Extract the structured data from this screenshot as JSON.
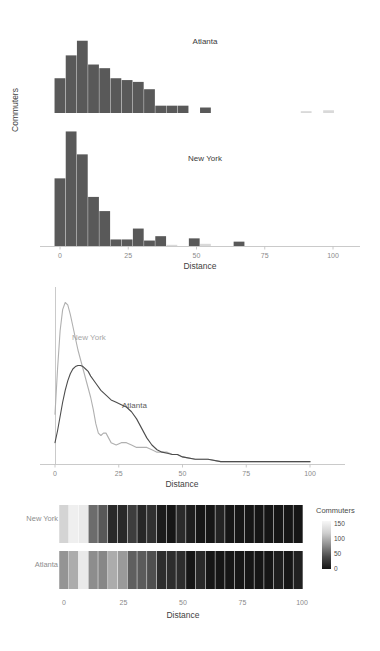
{
  "figure": {
    "title": "",
    "panels": [
      "histogram-facets",
      "density-overlay",
      "heatmap-strips"
    ]
  },
  "colors": {
    "bar": "#595959",
    "bar_faint": "#d9d9d9",
    "axis": "#bdbdbd",
    "tick_text": "#8a8a8a",
    "atlanta_curve": "#4d4d4d",
    "newyork_curve": "#b0b0b0",
    "atlanta_label": "#5b5b5b",
    "newyork_label": "#a8a8a8",
    "heat_low": "#1a1a1a",
    "heat_high": "#f2f2f2"
  },
  "axis": {
    "x_title": "Distance",
    "y_title": "Commuters",
    "x_ticks": [
      "0",
      "25",
      "50",
      "75",
      "100"
    ],
    "x_tick_values": [
      0,
      25,
      50,
      75,
      100
    ],
    "xlim": [
      -3,
      104
    ]
  },
  "panel_histogram": {
    "facets": [
      {
        "label": "Atlanta"
      },
      {
        "label": "New York"
      }
    ]
  },
  "panel_density": {
    "labels": [
      {
        "name": "New York",
        "x": 14,
        "y": 0.048
      },
      {
        "name": "Atlanta",
        "x": 27,
        "y": 0.028
      }
    ]
  },
  "panel_heatmap": {
    "rows": [
      "New York",
      "Atlanta"
    ],
    "legend": {
      "title": "Commuters",
      "ticks": [
        "150",
        "100",
        "50",
        "0"
      ],
      "tick_values": [
        150,
        100,
        50,
        0
      ],
      "range": [
        0,
        160
      ]
    }
  },
  "chart_data": [
    {
      "type": "bar",
      "id": "histogram-atlanta",
      "title": "Atlanta",
      "xlabel": "Distance",
      "ylabel": "Commuters",
      "bin_width": 4.1,
      "bin_starts": [
        -2.0,
        2.1,
        6.2,
        10.3,
        14.4,
        18.5,
        22.6,
        26.7,
        30.8,
        34.9,
        39.0,
        43.1,
        47.2,
        51.3,
        55.4,
        59.5,
        63.6,
        67.7,
        71.8,
        75.9,
        80.0,
        84.1,
        88.2,
        92.3,
        96.4,
        100.5
      ],
      "values": [
        38,
        63,
        79,
        53,
        49,
        38,
        36,
        34,
        26,
        8,
        8,
        8,
        0,
        6,
        0,
        0,
        0,
        0,
        0,
        0,
        0,
        0,
        2,
        0,
        3,
        0
      ],
      "ylim": [
        0,
        82
      ],
      "grid": false
    },
    {
      "type": "bar",
      "id": "histogram-newyork",
      "title": "New York",
      "xlabel": "Distance",
      "ylabel": "Commuters",
      "bin_width": 4.1,
      "bin_starts": [
        -2.0,
        2.1,
        6.2,
        10.3,
        14.4,
        18.5,
        22.6,
        26.7,
        30.8,
        34.9,
        39.0,
        43.1,
        47.2,
        51.3,
        55.4,
        59.5,
        63.6,
        67.7,
        71.8,
        75.9,
        80.0,
        84.1,
        88.2,
        92.3,
        96.4,
        100.5
      ],
      "values": [
        62,
        105,
        84,
        45,
        32,
        6,
        6,
        16,
        5,
        9,
        1,
        0,
        7,
        2,
        0,
        0,
        4,
        0,
        0,
        0,
        0,
        0,
        0,
        0,
        0,
        0
      ],
      "ylim": [
        0,
        110
      ],
      "grid": false
    },
    {
      "type": "line",
      "id": "density-overlay",
      "xlabel": "Distance",
      "ylabel": "",
      "xlim": [
        0,
        100
      ],
      "ylim": [
        0,
        0.072
      ],
      "grid": false,
      "legend_position": "inline-annotation",
      "series": [
        {
          "name": "New York",
          "color": "#b0b0b0",
          "x": [
            0,
            1,
            2,
            3,
            4,
            5,
            6,
            7,
            8,
            9,
            10,
            11,
            12,
            13,
            14,
            15,
            16,
            17,
            18,
            19,
            20,
            22,
            24,
            26,
            28,
            30,
            32,
            34,
            36,
            38,
            40,
            42,
            44,
            46,
            48,
            50,
            55,
            60,
            65,
            70,
            75,
            80,
            85,
            90,
            95,
            100
          ],
          "y": [
            0.021,
            0.04,
            0.056,
            0.065,
            0.068,
            0.067,
            0.063,
            0.058,
            0.053,
            0.048,
            0.044,
            0.04,
            0.036,
            0.032,
            0.028,
            0.023,
            0.017,
            0.013,
            0.012,
            0.013,
            0.013,
            0.009,
            0.008,
            0.009,
            0.009,
            0.008,
            0.007,
            0.007,
            0.007,
            0.006,
            0.005,
            0.005,
            0.005,
            0.004,
            0.004,
            0.003,
            0.002,
            0.002,
            0.001,
            0.001,
            0.001,
            0.001,
            0.001,
            0.001,
            0.001,
            0.001
          ]
        },
        {
          "name": "Atlanta",
          "color": "#4d4d4d",
          "x": [
            0,
            1,
            2,
            3,
            4,
            5,
            6,
            7,
            8,
            9,
            10,
            11,
            12,
            13,
            14,
            16,
            18,
            20,
            22,
            24,
            26,
            28,
            30,
            32,
            34,
            36,
            38,
            40,
            42,
            44,
            46,
            48,
            50,
            55,
            60,
            65,
            70,
            75,
            80,
            85,
            90,
            95,
            100
          ],
          "y": [
            0.009,
            0.014,
            0.02,
            0.026,
            0.031,
            0.035,
            0.038,
            0.04,
            0.041,
            0.0415,
            0.0415,
            0.041,
            0.04,
            0.039,
            0.037,
            0.034,
            0.031,
            0.029,
            0.027,
            0.026,
            0.025,
            0.024,
            0.022,
            0.019,
            0.015,
            0.011,
            0.008,
            0.006,
            0.005,
            0.0045,
            0.004,
            0.004,
            0.003,
            0.002,
            0.002,
            0.001,
            0.001,
            0.001,
            0.001,
            0.001,
            0.001,
            0.001,
            0.001
          ]
        }
      ]
    },
    {
      "type": "heatmap",
      "id": "heatmap-strips",
      "xlabel": "Distance",
      "ylabel": "",
      "colorbar_label": "Commuters",
      "colorbar_range": [
        0,
        160
      ],
      "xlim": [
        -2,
        102
      ],
      "rows": [
        "New York",
        "Atlanta"
      ],
      "bin_starts": [
        -2.0,
        2.1,
        6.2,
        10.3,
        14.4,
        18.5,
        22.6,
        26.7,
        30.8,
        34.9,
        39.0,
        43.1,
        47.2,
        51.3,
        55.4,
        59.5,
        63.6,
        67.7,
        71.8,
        75.9,
        80.0,
        84.1,
        88.2,
        92.3,
        96.4
      ],
      "series": [
        {
          "name": "New York",
          "values": [
            130,
            155,
            150,
            45,
            32,
            6,
            6,
            16,
            5,
            9,
            1,
            0,
            7,
            2,
            0,
            0,
            4,
            0,
            0,
            0,
            0,
            0,
            0,
            0,
            0
          ]
        },
        {
          "name": "Atlanta",
          "values": [
            75,
            95,
            150,
            70,
            65,
            95,
            80,
            36,
            34,
            26,
            8,
            8,
            8,
            0,
            6,
            0,
            0,
            0,
            0,
            0,
            0,
            0,
            2,
            0,
            3
          ]
        }
      ]
    }
  ]
}
